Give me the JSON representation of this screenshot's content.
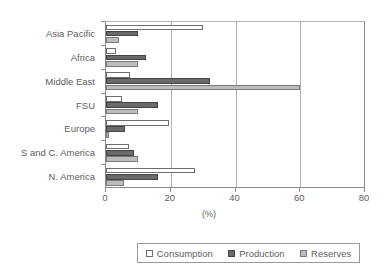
{
  "chart_data": {
    "type": "bar",
    "orientation": "horizontal",
    "title": "",
    "xlabel": "(%)",
    "ylabel": "",
    "xlim": [
      0,
      80
    ],
    "xticks": [
      0,
      20,
      40,
      60,
      80
    ],
    "grid": true,
    "legend_position": "bottom",
    "categories": [
      "N. America",
      "S and C. America",
      "Europe",
      "FSU",
      "Middle East",
      "Africa",
      "Asia Pacific"
    ],
    "series": [
      {
        "name": "Consumption",
        "color": "#ffffff",
        "values": [
          27.5,
          7.0,
          19.5,
          5.0,
          7.5,
          3.0,
          30.0
        ]
      },
      {
        "name": "Production",
        "color": "#6a6a6a",
        "values": [
          16.0,
          8.5,
          6.0,
          16.0,
          32.0,
          12.5,
          10.0
        ]
      },
      {
        "name": "Reserves",
        "color": "#bcbcbc",
        "values": [
          5.5,
          10.0,
          1.0,
          10.0,
          60.0,
          10.0,
          4.0
        ]
      }
    ]
  },
  "axis": {
    "x_title": "(%)",
    "tick_labels": [
      "0",
      "20",
      "40",
      "60",
      "80"
    ]
  },
  "legend": {
    "items": [
      {
        "label": "Consumption"
      },
      {
        "label": "Production"
      },
      {
        "label": "Reserves"
      }
    ]
  }
}
